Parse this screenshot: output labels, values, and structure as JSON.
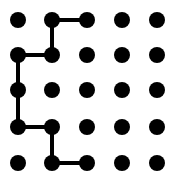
{
  "diagram": {
    "type": "dot-grid-path",
    "grid": {
      "rows": 5,
      "cols": 5
    },
    "dot_color": "#000000",
    "line_color": "#000000",
    "background": "#ffffff",
    "path": [
      [
        0,
        2
      ],
      [
        0,
        1
      ],
      [
        1,
        1
      ],
      [
        1,
        0
      ],
      [
        2,
        0
      ],
      [
        3,
        0
      ],
      [
        3,
        1
      ],
      [
        4,
        1
      ],
      [
        4,
        2
      ]
    ],
    "path_note": "points as [row,col]"
  }
}
